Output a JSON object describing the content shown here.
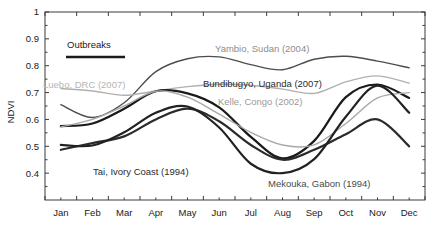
{
  "chart_data": {
    "type": "line",
    "title": "",
    "xlabel": "",
    "ylabel": "NDVI",
    "ylim": [
      0.3,
      1.0
    ],
    "xlim": [
      0,
      12
    ],
    "grid": false,
    "legend_position": "inline-annotations",
    "categories": [
      "Jan",
      "Feb",
      "Mar",
      "Apr",
      "May",
      "Jun",
      "Jul",
      "Aug",
      "Sep",
      "Oct",
      "Nov",
      "Dec"
    ],
    "xticklabels": [
      "Jan",
      "Feb",
      "Mar",
      "Apr",
      "May",
      "Jun",
      "Jul",
      "Aug",
      "Sep",
      "Oct",
      "Nov",
      "Dec"
    ],
    "yticklabels": [
      "0.4",
      "0.5",
      "0.6",
      "0.7",
      "0.8",
      "0.9",
      "1"
    ],
    "yticks": [
      0.4,
      0.5,
      0.6,
      0.7,
      0.8,
      0.9,
      1.0
    ],
    "legend": {
      "label": "Outbreaks",
      "swatch_color": "#1a1a1a",
      "swatch_style": "thick-solid-line"
    },
    "series": [
      {
        "name": "Yambio, Sudan (2004)",
        "label": "Yambio, Sudan (2004)",
        "color": "#4d4d4d",
        "width": 1.4,
        "values": [
          0.655,
          0.607,
          0.662,
          0.778,
          0.826,
          0.833,
          0.804,
          0.785,
          0.824,
          0.835,
          0.817,
          0.792
        ]
      },
      {
        "name": "Luebo, DRC (2007)",
        "label": "Luebo, DRC (2007)",
        "color": "#b0b0b0",
        "width": 1.4,
        "values": [
          0.715,
          0.706,
          0.69,
          0.706,
          0.722,
          0.731,
          0.727,
          0.713,
          0.697,
          0.74,
          0.762,
          0.735
        ]
      },
      {
        "name": "Bundibugyo, Uganda (2007)",
        "label": "Bundibugyo, Uganda (2007)",
        "color": "#1a1a1a",
        "width": 2.2,
        "values": [
          0.575,
          0.585,
          0.64,
          0.705,
          0.697,
          0.645,
          0.535,
          0.455,
          0.52,
          0.683,
          0.73,
          0.68
        ]
      },
      {
        "name": "Kelle, Congo (2002)",
        "label": "Kelle, Congo (2002)",
        "color": "#a8a8a8",
        "width": 1.4,
        "values": [
          0.572,
          0.6,
          0.65,
          0.705,
          0.683,
          0.62,
          0.552,
          0.505,
          0.505,
          0.585,
          0.68,
          0.7
        ]
      },
      {
        "name": "Tai, Ivory Coast (1994)",
        "label": "Tai, Ivory Coast (1994)",
        "color": "#2b2b2b",
        "width": 2.2,
        "values": [
          0.487,
          0.512,
          0.537,
          0.6,
          0.64,
          0.593,
          0.505,
          0.45,
          0.487,
          0.545,
          0.6,
          0.5
        ]
      },
      {
        "name": "Mekouka, Gabon (1994)",
        "label": "Mekouka, Gabon (1994)",
        "color": "#222222",
        "width": 2.2,
        "values": [
          0.505,
          0.503,
          0.552,
          0.625,
          0.648,
          0.57,
          0.435,
          0.4,
          0.452,
          0.61,
          0.726,
          0.625
        ]
      }
    ],
    "annotations": [
      {
        "text": "Yambio, Sudan (2004)",
        "x_px": 215,
        "y_px": 52,
        "color": "#8c8c8c"
      },
      {
        "text": "Luebo, DRC (2007)",
        "x_px": 43,
        "y_px": 88,
        "color": "#b5b5b5"
      },
      {
        "text": "Bundibugyo, Uganda (2007)",
        "x_px": 203,
        "y_px": 87,
        "color": "#2b2b2b"
      },
      {
        "text": "Kelle, Congo (2002)",
        "x_px": 218,
        "y_px": 105,
        "color": "#9a9a9a"
      },
      {
        "text": "Tai, Ivory Coast (1994)",
        "x_px": 93,
        "y_px": 175,
        "color": "#2b2b2b"
      },
      {
        "text": "Mekouka, Gabon (1994)",
        "x_px": 268,
        "y_px": 187,
        "color": "#4a4a4a"
      }
    ]
  },
  "axes": {
    "y_title": "NDVI",
    "y_ticks": [
      {
        "label": "1",
        "value": 1.0
      },
      {
        "label": "0.9",
        "value": 0.9
      },
      {
        "label": "0.8",
        "value": 0.8
      },
      {
        "label": "0.7",
        "value": 0.7
      },
      {
        "label": "0.6",
        "value": 0.6
      },
      {
        "label": "0.5",
        "value": 0.5
      },
      {
        "label": "0.4",
        "value": 0.4
      }
    ],
    "x_ticks": [
      {
        "label": "Jan"
      },
      {
        "label": "Feb"
      },
      {
        "label": "Mar"
      },
      {
        "label": "Apr"
      },
      {
        "label": "May"
      },
      {
        "label": "Jun"
      },
      {
        "label": "Jul"
      },
      {
        "label": "Aug"
      },
      {
        "label": "Sep"
      },
      {
        "label": "Oct"
      },
      {
        "label": "Nov"
      },
      {
        "label": "Dec"
      }
    ]
  },
  "legend": {
    "outbreaks_label": "Outbreaks"
  }
}
